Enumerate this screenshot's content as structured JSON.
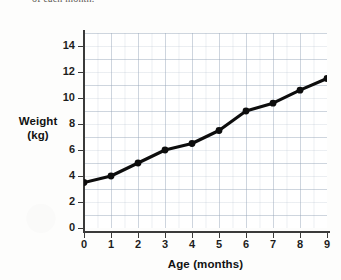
{
  "caption": {
    "cropped_line": "of each month."
  },
  "chart_data": {
    "type": "line",
    "title": "",
    "xlabel": "Age (months)",
    "ylabel": "Weight (kg)",
    "ylabel_lines": [
      "Weight",
      "(kg)"
    ],
    "x": [
      0,
      1,
      2,
      3,
      4,
      5,
      6,
      7,
      8,
      9
    ],
    "values": [
      3.5,
      4.0,
      5.0,
      6.0,
      6.5,
      7.5,
      9.0,
      9.6,
      10.6,
      11.5
    ],
    "categories": [
      "0",
      "1",
      "2",
      "3",
      "4",
      "5",
      "6",
      "7",
      "8",
      "9"
    ],
    "xlim": [
      0,
      9
    ],
    "ylim": [
      0,
      15
    ],
    "xticks": [
      0,
      1,
      2,
      3,
      4,
      5,
      6,
      7,
      8,
      9
    ],
    "xtick_labels": [
      "0",
      "1",
      "2",
      "3",
      "4",
      "5",
      "6",
      "7",
      "8",
      "9"
    ],
    "yticks": [
      0,
      2,
      4,
      6,
      8,
      10,
      12,
      14
    ],
    "ytick_labels": [
      "0",
      "2",
      "4",
      "6",
      "8",
      "10",
      "12",
      "14"
    ],
    "grid": true,
    "grid_minor_step": 0.5,
    "legend": false,
    "legend_position": "none",
    "series": [
      {
        "name": "Weight",
        "marker": "filled-circle",
        "color": "#0d0d0d",
        "values": [
          3.5,
          4.0,
          5.0,
          6.0,
          6.5,
          7.5,
          9.0,
          9.6,
          10.6,
          11.5
        ]
      }
    ],
    "colors": {
      "line": "#0d0d0d",
      "marker": "#0d0d0d",
      "grid": "#96a5b9",
      "axis": "#3a3a3a",
      "text": "#1d1d1d",
      "background": "#ffffff"
    }
  }
}
